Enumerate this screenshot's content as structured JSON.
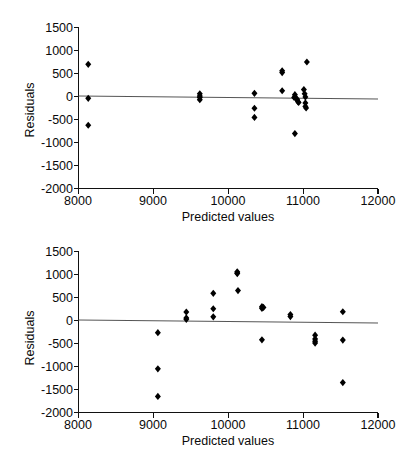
{
  "figure": {
    "background": "#ffffff",
    "marker_color": "#000000",
    "axis_color": "#111111",
    "zero_line_color": "#555555",
    "marker_shape": "filled-diamond"
  },
  "chart_data": [
    {
      "type": "scatter",
      "id": "residuals-plot-top",
      "title": "",
      "xlabel": "Predicted values",
      "ylabel": "Residuals",
      "xlim": [
        8000,
        12000
      ],
      "ylim": [
        -2000,
        1500
      ],
      "xticks": [
        8000,
        9000,
        10000,
        11000,
        12000
      ],
      "xtick_labels": [
        "8000",
        "9000",
        "10000",
        "11000",
        "12000"
      ],
      "yticks": [
        1500,
        1000,
        500,
        0,
        -500,
        -1000,
        -1500,
        -2000
      ],
      "ytick_labels": [
        "1500",
        "1000",
        "500",
        "0",
        "-500",
        "-1000",
        "-1500",
        "-2000"
      ],
      "grid": false,
      "legend": null,
      "reference_line": {
        "type": "horizontal-trend",
        "y_left": 20,
        "y_right": -40
      },
      "x": [
        8130,
        8130,
        8130,
        9620,
        9620,
        9620,
        9620,
        10350,
        10350,
        10350,
        10720,
        10720,
        10720,
        10880,
        10890,
        10900,
        10920,
        10930,
        10940,
        10890,
        11010,
        11020,
        11030,
        11030,
        11030,
        11040,
        11050
      ],
      "y": [
        700,
        -40,
        -625,
        60,
        10,
        -20,
        -70,
        70,
        -255,
        -455,
        520,
        560,
        125,
        -20,
        40,
        -30,
        -60,
        -110,
        -130,
        -805,
        150,
        60,
        -10,
        -140,
        -215,
        -250,
        750
      ]
    },
    {
      "type": "scatter",
      "id": "residuals-plot-bottom",
      "title": "",
      "xlabel": "Predicted values",
      "ylabel": "Residuals",
      "xlim": [
        8000,
        12000
      ],
      "ylim": [
        -2000,
        1500
      ],
      "xticks": [
        8000,
        9000,
        10000,
        11000,
        12000
      ],
      "xtick_labels": [
        "8000",
        "9000",
        "10000",
        "11000",
        "12000"
      ],
      "yticks": [
        1500,
        1000,
        500,
        0,
        -500,
        -1000,
        -1500,
        -2000
      ],
      "ytick_labels": [
        "1500",
        "1000",
        "500",
        "0",
        "-500",
        "-1000",
        "-1500",
        "-2000"
      ],
      "grid": false,
      "legend": null,
      "reference_line": {
        "type": "horizontal-trend",
        "y_left": 20,
        "y_right": -50
      },
      "x": [
        9060,
        9060,
        9060,
        9440,
        9440,
        9440,
        9800,
        9800,
        9800,
        10120,
        10120,
        10120,
        10130,
        10450,
        10450,
        10450,
        10470,
        10830,
        10830,
        11160,
        11160,
        11160,
        11160,
        11530,
        11530,
        11530
      ],
      "y": [
        -265,
        -1050,
        -1650,
        185,
        55,
        25,
        590,
        255,
        80,
        1060,
        1020,
        1035,
        650,
        300,
        265,
        -420,
        285,
        130,
        85,
        -320,
        -400,
        -450,
        -490,
        190,
        -425,
        -1350
      ]
    }
  ]
}
